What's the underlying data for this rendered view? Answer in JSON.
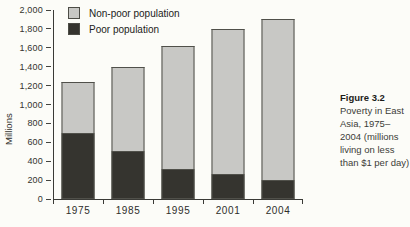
{
  "figure": {
    "caption_label": "Figure 3.2",
    "caption_text": "Poverty in East Asia, 1975–2004 (millions living on less than $1 per day)"
  },
  "chart_data": {
    "type": "bar",
    "stacked": true,
    "title": "",
    "xlabel": "",
    "ylabel": "Millions",
    "categories": [
      "1975",
      "1985",
      "1995",
      "2001",
      "2004"
    ],
    "series": [
      {
        "name": "Poor population",
        "color": "#35342f",
        "values": [
          700,
          510,
          320,
          270,
          200
        ]
      },
      {
        "name": "Non-poor population",
        "color": "#c8c8c5",
        "values": [
          540,
          890,
          1300,
          1530,
          1710
        ]
      }
    ],
    "totals": [
      1240,
      1400,
      1620,
      1800,
      1910
    ],
    "ylim": [
      0,
      2000
    ],
    "ytick_step": 200,
    "ytick_labels": [
      "0",
      "200",
      "400",
      "600",
      "800",
      "1,000",
      "1,200",
      "1,400",
      "1,600",
      "1,800",
      "2,000"
    ],
    "grid": false,
    "legend_position": "top-left",
    "legend": [
      {
        "label": "Non-poor population",
        "color": "#c8c8c5"
      },
      {
        "label": "Poor population",
        "color": "#35342f"
      }
    ],
    "colors": {
      "axis": "#3a3a36",
      "bar_border": "#50504a",
      "background": "#fcfcf8"
    }
  }
}
